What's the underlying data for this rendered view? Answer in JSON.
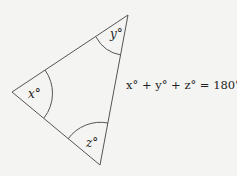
{
  "diagram": {
    "type": "triangle-angle-sum",
    "vertices": {
      "left": [
        12,
        92
      ],
      "top": [
        128,
        15
      ],
      "bottom": [
        100,
        165
      ]
    },
    "angle_labels": {
      "left": "x°",
      "top": "y°",
      "bottom": "z°"
    },
    "equation": "x° + y° + z° = 180°",
    "colors": {
      "stroke": "#555555",
      "text": "#222222",
      "background": "#f4f4f2"
    }
  }
}
